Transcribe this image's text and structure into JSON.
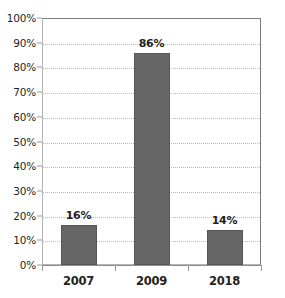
{
  "chart_data": {
    "type": "bar",
    "title": "",
    "subtitle": "",
    "xlabel": "",
    "ylabel": "",
    "categories": [
      "2007",
      "2009",
      "2018"
    ],
    "values": [
      16,
      86,
      14
    ],
    "data_labels": [
      "16%",
      "86%",
      "14%"
    ],
    "series": [
      {
        "name": "",
        "values": [
          16,
          86,
          14
        ]
      }
    ],
    "ylim": [
      0,
      100
    ],
    "y_tick_step": 10,
    "y_tick_labels": [
      "100%",
      "90%",
      "80%",
      "70%",
      "60%",
      "50%",
      "40%",
      "30%",
      "20%",
      "10%",
      "0%"
    ],
    "y_tick_values": [
      100,
      90,
      80,
      70,
      60,
      50,
      40,
      30,
      20,
      10,
      0
    ],
    "grid": true,
    "grid_axis": "y",
    "legend": false,
    "legend_position": "none",
    "annotations": []
  },
  "style": {
    "bar_color": "#666666",
    "bar_border_color": "#555555",
    "grid_color": "#b9b9b9",
    "axis_color": "#8d8d8d",
    "frame_color": "#7d7d7d",
    "text_color": "#231f20",
    "background": "#ffffff"
  }
}
